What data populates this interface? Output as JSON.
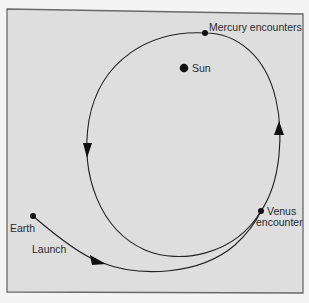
{
  "diagram": {
    "background": "#dedede",
    "frame_color": "#6a6a6a",
    "line_color": "#222222",
    "labels": {
      "sun": "Sun",
      "mercury": "Mercury encounters",
      "venus_line1": "Venus",
      "venus_line2": "encounter",
      "earth": "Earth",
      "launch": "Launch"
    },
    "points": {
      "sun": {
        "x": 184,
        "y": 68
      },
      "mercury_encounter": {
        "x": 205,
        "y": 33
      },
      "venus_encounter": {
        "x": 261,
        "y": 211
      },
      "earth": {
        "x": 33,
        "y": 216
      }
    },
    "arrows": [
      {
        "name": "left-orbit-arrow",
        "direction": "down"
      },
      {
        "name": "right-orbit-arrow",
        "direction": "up"
      },
      {
        "name": "launch-arrow",
        "direction": "right"
      }
    ]
  }
}
